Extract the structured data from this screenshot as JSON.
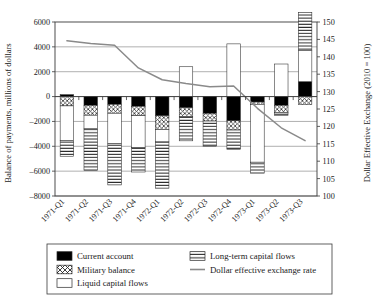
{
  "chart_data": {
    "type": "bar",
    "title": "",
    "subtitle": "",
    "xlabel": "",
    "ylabel": "Balance of payments, millions of dollars",
    "y2label": "Dollar Effective Exchange (2010 = 100)",
    "categories": [
      "1971-Q1",
      "1971-Q2",
      "1971-Q3",
      "1971-Q4",
      "1972-Q1",
      "1972-Q2",
      "1972-Q3",
      "1972-Q4",
      "1973-Q1",
      "1973-Q2",
      "1973-Q3"
    ],
    "ylim": [
      -8000,
      6000
    ],
    "yticks": [
      -8000,
      -6000,
      -4000,
      -2000,
      0,
      2000,
      4000,
      6000
    ],
    "ytick_labels": [
      "-8000",
      "-6000",
      "-4000",
      "-2000",
      "0",
      "2000",
      "4000",
      "6000"
    ],
    "y2lim": [
      100,
      150
    ],
    "y2ticks": [
      100,
      105,
      110,
      115,
      120,
      125,
      130,
      135,
      140,
      145,
      150
    ],
    "y2tick_labels": [
      "100",
      "105",
      "110",
      "115",
      "120",
      "125",
      "130",
      "135",
      "140",
      "145",
      "150"
    ],
    "grid": true,
    "legend_position": "bottom",
    "stacked": true,
    "series": [
      {
        "name": "Current account",
        "pattern": "solid-black",
        "color": "#000000",
        "values": [
          150,
          -700,
          -620,
          -780,
          -1550,
          -900,
          -1350,
          -1950,
          -440,
          -700,
          1200
        ]
      },
      {
        "name": "Military balance",
        "pattern": "diagonal-crosshatch",
        "color": "#ffffff",
        "values": [
          -750,
          -800,
          -720,
          -760,
          -1100,
          -700,
          -620,
          -740,
          -180,
          -580,
          -640
        ]
      },
      {
        "name": "Liquid capital flows",
        "pattern": "blank-white",
        "color": "#ffffff",
        "values": [
          -2780,
          -1100,
          -2440,
          -2550,
          -1000,
          2400,
          0,
          4240,
          -4660,
          2620,
          2500
        ]
      },
      {
        "name": "Long-term capital flows",
        "pattern": "horizontal-lines",
        "color": "#ffffff",
        "values": [
          -1270,
          -3330,
          -3330,
          -1980,
          -3720,
          -1960,
          -2050,
          -1550,
          -880,
          -230,
          3060
        ]
      }
    ],
    "line_series": {
      "name": "Dollar effective exchange rate",
      "color": "#8a8a8a",
      "axis": "right",
      "values": [
        144.6,
        143.8,
        143.3,
        136.8,
        133.4,
        132.3,
        131.4,
        131.6,
        125.2,
        119.6,
        115.9
      ]
    },
    "legend": [
      {
        "label": "Current account",
        "swatch": "solid-black"
      },
      {
        "label": "Long-term capital flows",
        "swatch": "horizontal-lines"
      },
      {
        "label": "Military balance",
        "swatch": "diagonal-crosshatch"
      },
      {
        "label": "Dollar effective exchange rate",
        "swatch": "line"
      },
      {
        "label": "Liquid capital flows",
        "swatch": "blank-white"
      }
    ]
  }
}
